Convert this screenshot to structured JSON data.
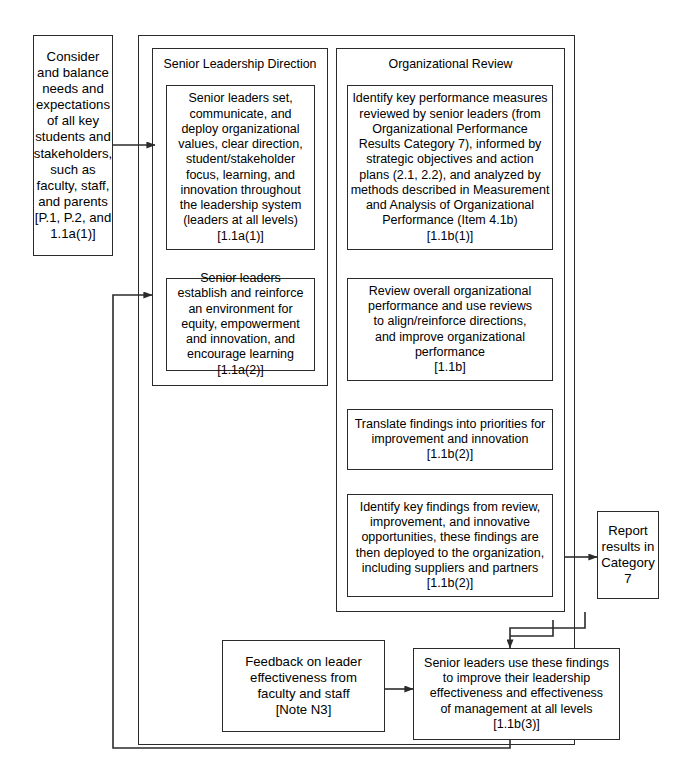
{
  "diagram": {
    "stroke_color": "#2b2b2b",
    "background_color": "#ffffff"
  },
  "panels": {
    "outer": {
      "name": "leadership-system-container"
    },
    "senior_leadership": {
      "title": "Senior Leadership Direction"
    },
    "organizational_review": {
      "title": "Organizational Review"
    }
  },
  "boxes": {
    "inputs": {
      "text": "Consider\nand balance\nneeds and\nexpectations\nof all key\nstudents and\nstakeholders,\nsuch as\nfaculty, staff,\nand parents\n[P.1, P.2, and\n1.1a(1)]"
    },
    "sld_1": {
      "text": "Senior leaders set,\ncommunicate, and\ndeploy organizational\nvalues, clear direction,\nstudent/stakeholder\nfocus, learning, and\ninnovation throughout\nthe leadership system\n(leaders at all levels)\n[1.1a(1)]"
    },
    "sld_2": {
      "text": "Senior leaders\nestablish and reinforce\nan environment for\nequity, empowerment\nand innovation, and\nencourage learning\n[1.1a(2)]"
    },
    "or_1": {
      "text": "Identify key performance measures\nreviewed by senior leaders (from\nOrganizational Performance\nResults Category 7), informed by\nstrategic objectives and action\nplans (2.1, 2.2), and analyzed by\nmethods described in Measurement\nand Analysis of Organizational\nPerformance (Item 4.1b)\n[1.1b(1)]"
    },
    "or_2": {
      "text": "Review overall organizational\nperformance and use reviews\nto align/reinforce directions,\nand improve organizational\nperformance\n[1.1b]"
    },
    "or_3": {
      "text": "Translate findings into priorities for\nimprovement and innovation\n[1.1b(2)]"
    },
    "or_4": {
      "text": "Identify key findings from review,\nimprovement, and innovative\nopportunities, these findings are\nthen deployed to the organization,\nincluding suppliers and partners\n[1.1b(2)]"
    },
    "report": {
      "text": "Report\nresults in\nCategory\n7"
    },
    "feedback": {
      "text": "Feedback on leader\neffectiveness from\nfaculty and staff\n[Note N3]"
    },
    "senior_leaders_use": {
      "text": "Senior leaders use these findings\nto improve their leadership\neffectiveness and effectiveness\nof management at all levels\n[1.1b(3)]"
    }
  },
  "connectors": [
    {
      "name": "inputs-to-leadership-system",
      "type": "arrow"
    },
    {
      "name": "feedback-loop-to-leadership-system",
      "type": "arrow"
    },
    {
      "name": "or4-to-report-results",
      "type": "arrow"
    },
    {
      "name": "feedback-note-to-senior-leaders-use",
      "type": "arrow"
    },
    {
      "name": "review-chain-to-senior-leaders-use",
      "type": "arrow"
    },
    {
      "name": "senior-leaders-use-return-loop",
      "type": "line"
    }
  ]
}
